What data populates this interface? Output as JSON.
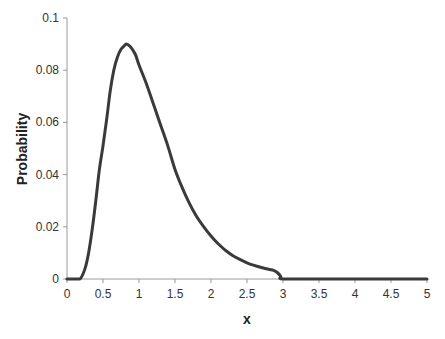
{
  "chart_data": {
    "type": "line",
    "title": "",
    "xlabel": "x",
    "ylabel": "Probability",
    "xlim": [
      0,
      5
    ],
    "ylim": [
      0,
      0.1
    ],
    "x_ticks": [
      "0",
      "0.5",
      "1",
      "1.5",
      "2",
      "2.5",
      "3",
      "3.5",
      "4",
      "4.5",
      "5"
    ],
    "y_ticks": [
      "0",
      "0.02",
      "0.04",
      "0.06",
      "0.08",
      "0.1"
    ],
    "grid": false,
    "legend": null,
    "line_color": "#3a3a3a",
    "series": [
      {
        "name": "Probability",
        "x": [
          0,
          0.1,
          0.18,
          0.25,
          0.3,
          0.35,
          0.4,
          0.45,
          0.5,
          0.55,
          0.6,
          0.65,
          0.7,
          0.75,
          0.8,
          0.83,
          0.88,
          0.95,
          1.0,
          1.1,
          1.2,
          1.3,
          1.4,
          1.5,
          1.6,
          1.7,
          1.8,
          1.9,
          2.0,
          2.1,
          2.2,
          2.3,
          2.4,
          2.5,
          2.6,
          2.7,
          2.8,
          2.87,
          2.92,
          2.97,
          3.0,
          3.5,
          4.0,
          4.5,
          5.0
        ],
        "values": [
          0,
          0,
          0,
          0.004,
          0.01,
          0.019,
          0.03,
          0.042,
          0.051,
          0.061,
          0.072,
          0.08,
          0.085,
          0.088,
          0.0895,
          0.09,
          0.089,
          0.086,
          0.082,
          0.075,
          0.067,
          0.059,
          0.051,
          0.042,
          0.035,
          0.029,
          0.024,
          0.02,
          0.0165,
          0.0135,
          0.011,
          0.009,
          0.0075,
          0.0062,
          0.0052,
          0.0044,
          0.0037,
          0.0033,
          0.0025,
          0.001,
          0,
          0,
          0,
          0,
          0
        ]
      }
    ]
  }
}
